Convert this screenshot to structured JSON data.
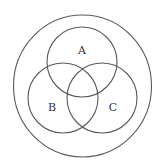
{
  "diagram": {
    "type": "venn",
    "universe": {
      "label": "",
      "cx": 82.5,
      "cy": 86,
      "rx": 69,
      "ry": 71
    },
    "sets": [
      {
        "label": "A",
        "cx": 82,
        "cy": 62,
        "r": 35,
        "label_x": 82,
        "label_y": 54
      },
      {
        "label": "B",
        "cx": 63,
        "cy": 98,
        "r": 35,
        "label_x": 52,
        "label_y": 111
      },
      {
        "label": "C",
        "cx": 102,
        "cy": 98,
        "r": 35,
        "label_x": 113,
        "label_y": 111
      }
    ],
    "stroke_color": "#5a5a5a",
    "background": "#ffffff"
  }
}
